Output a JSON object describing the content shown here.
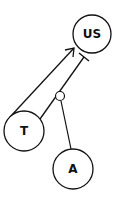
{
  "diagram": {
    "nodes": [
      {
        "id": "US",
        "label": "US",
        "cx": 92,
        "cy": 34,
        "r": 19
      },
      {
        "id": "T",
        "label": "T",
        "cx": 24,
        "cy": 131,
        "r": 20
      },
      {
        "id": "A",
        "label": "A",
        "cx": 73,
        "cy": 169,
        "r": 20
      }
    ],
    "edges": [
      {
        "from": "T",
        "to": "US",
        "type": "activation-arrow"
      },
      {
        "from": "T",
        "to": "US",
        "type": "inhibition-bar"
      },
      {
        "from": "A",
        "to": "inhibition-bar",
        "type": "modulation"
      }
    ],
    "colors": {
      "stroke": "#111111",
      "background": "#ffffff"
    }
  }
}
